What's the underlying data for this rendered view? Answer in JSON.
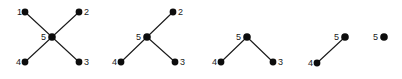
{
  "figure": {
    "title": "",
    "width": 402,
    "height": 79,
    "background_color": "#ffffff",
    "node_color": "#0d0d0d",
    "edge_color": "#1a1a1a",
    "label_color": "#1a1a1a"
  },
  "graphs": [
    {
      "id": "graph-1",
      "name": "star-graph-full",
      "offset_x": 0,
      "nodes": [
        {
          "label": "1",
          "x": 25,
          "y": 12,
          "label_x": 17,
          "label_y": 15,
          "r": 3.4
        },
        {
          "label": "2",
          "x": 79,
          "y": 12,
          "label_x": 84,
          "label_y": 15,
          "r": 3.4
        },
        {
          "label": "5",
          "x": 52,
          "y": 37,
          "label_x": 41,
          "label_y": 40,
          "r": 3.8
        },
        {
          "label": "4",
          "x": 25,
          "y": 62,
          "label_x": 16,
          "label_y": 65,
          "r": 3.4
        },
        {
          "label": "3",
          "x": 79,
          "y": 62,
          "label_x": 84,
          "label_y": 65,
          "r": 3.4
        }
      ],
      "edges": [
        {
          "from": "1",
          "to": "5"
        },
        {
          "from": "2",
          "to": "5"
        },
        {
          "from": "4",
          "to": "5"
        },
        {
          "from": "3",
          "to": "5"
        }
      ]
    },
    {
      "id": "graph-2",
      "name": "star-graph-minus-1",
      "offset_x": 96,
      "nodes": [
        {
          "label": "2",
          "x": 77,
          "y": 12,
          "label_x": 82,
          "label_y": 15,
          "r": 3.4
        },
        {
          "label": "5",
          "x": 51,
          "y": 37,
          "label_x": 40,
          "label_y": 40,
          "r": 3.8
        },
        {
          "label": "4",
          "x": 25,
          "y": 62,
          "label_x": 16,
          "label_y": 65,
          "r": 3.4
        },
        {
          "label": "3",
          "x": 79,
          "y": 62,
          "label_x": 84,
          "label_y": 65,
          "r": 3.4
        }
      ],
      "edges": [
        {
          "from": "2",
          "to": "5"
        },
        {
          "from": "4",
          "to": "5"
        },
        {
          "from": "3",
          "to": "5"
        }
      ]
    },
    {
      "id": "graph-3",
      "name": "star-graph-minus-1-2",
      "offset_x": 196,
      "nodes": [
        {
          "label": "5",
          "x": 51,
          "y": 37,
          "label_x": 40,
          "label_y": 40,
          "r": 3.8
        },
        {
          "label": "4",
          "x": 25,
          "y": 62,
          "label_x": 16,
          "label_y": 65,
          "r": 3.4
        },
        {
          "label": "3",
          "x": 77,
          "y": 62,
          "label_x": 82,
          "label_y": 65,
          "r": 3.4
        }
      ],
      "edges": [
        {
          "from": "4",
          "to": "5"
        },
        {
          "from": "3",
          "to": "5"
        }
      ]
    },
    {
      "id": "graph-4",
      "name": "star-graph-minus-1-2-3",
      "offset_x": 294,
      "nodes": [
        {
          "label": "5",
          "x": 51,
          "y": 37,
          "label_x": 40,
          "label_y": 40,
          "r": 3.8
        },
        {
          "label": "4",
          "x": 23,
          "y": 63,
          "label_x": 14,
          "label_y": 66,
          "r": 3.4
        }
      ],
      "edges": [
        {
          "from": "4",
          "to": "5"
        }
      ]
    },
    {
      "id": "graph-5",
      "name": "single-node-graph",
      "offset_x": 356,
      "nodes": [
        {
          "label": "5",
          "x": 28,
          "y": 37,
          "label_x": 17,
          "label_y": 40,
          "r": 3.8
        }
      ],
      "edges": []
    }
  ]
}
